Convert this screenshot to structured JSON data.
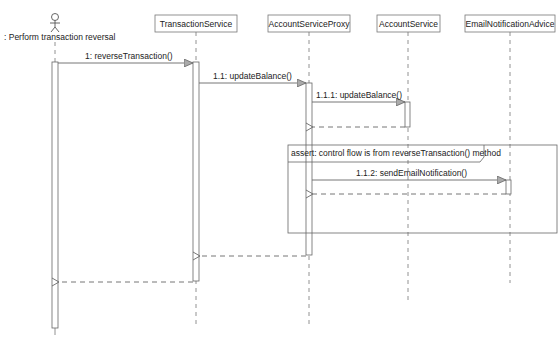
{
  "diagram": {
    "type": "sequence",
    "actor": {
      "label": ": Perform transaction reversal"
    },
    "lifelines": [
      {
        "name": "TransactionService"
      },
      {
        "name": "AccountServiceProxy"
      },
      {
        "name": "AccountService"
      },
      {
        "name": "EmailNotificationAdvice"
      }
    ],
    "messages": [
      {
        "label": "1: reverseTransaction()"
      },
      {
        "label": "1.1: updateBalance()"
      },
      {
        "label": "1.1.1: updateBalance()"
      },
      {
        "label": "1.1.2: sendEmailNotification()"
      }
    ],
    "fragment": {
      "label": "assert: control flow is from reverseTransaction() method"
    }
  }
}
